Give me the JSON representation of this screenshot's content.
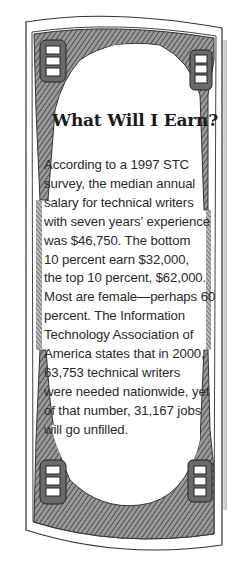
{
  "sidebar": {
    "title": "What Will I Earn?",
    "lines": [
      "According to a 1997 STC",
      "survey, the median annual",
      "salary for technical writers",
      "with seven years’ experience",
      "was $46,750. The bottom",
      "10 percent earn $32,000,",
      "the top 10 percent, $62,000.",
      "Most are female—perhaps 60",
      "percent. The Information",
      "Technology Association of",
      "America states that in 2000,",
      "63,753 technical writers",
      "were needed nationwide, yet",
      "of that number, 31,167 jobs",
      "will go unfilled."
    ],
    "corner_numerals": [
      "100",
      "100",
      "100",
      "100"
    ]
  },
  "colors": {
    "ink": "#2a2a2a",
    "engraving": "#555555",
    "paper": "#ffffff"
  }
}
